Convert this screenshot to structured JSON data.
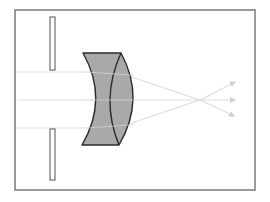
{
  "diagram": {
    "title": "",
    "colors": {
      "background": "#ffffff",
      "frame": "#7a7a7a",
      "slit": "#6e6e6e",
      "lens_fill": "#a9a9a9",
      "lens_stroke": "#2b2b2b",
      "ray": "#dedede"
    },
    "frame": {
      "x": 15,
      "y": 10,
      "width": 240,
      "height": 180
    },
    "slits": [
      {
        "name": "top",
        "x": 50,
        "y1": 17,
        "y2": 70,
        "width": 5
      },
      {
        "name": "bottom",
        "x": 50,
        "y1": 129,
        "y2": 180,
        "width": 5
      }
    ],
    "lens": {
      "top_edge": {
        "x1": 83,
        "y": 53,
        "x2": 121
      },
      "bottom_edge": {
        "x1": 82,
        "y": 145,
        "x2": 119
      },
      "left_curve_bulge_x": 97,
      "front_curve_bulge_x": 106,
      "back_curve_bulge_x": 134
    },
    "rays": [
      {
        "name": "upper",
        "y_in": 72,
        "focal": [
          200,
          100
        ],
        "tip": [
          235,
          82
        ]
      },
      {
        "name": "axis",
        "y_in": 100,
        "focal": [
          200,
          100
        ],
        "tip": [
          235,
          100
        ]
      },
      {
        "name": "lower",
        "y_in": 128,
        "focal": [
          200,
          100
        ],
        "tip": [
          234,
          116
        ]
      }
    ],
    "labels": []
  }
}
